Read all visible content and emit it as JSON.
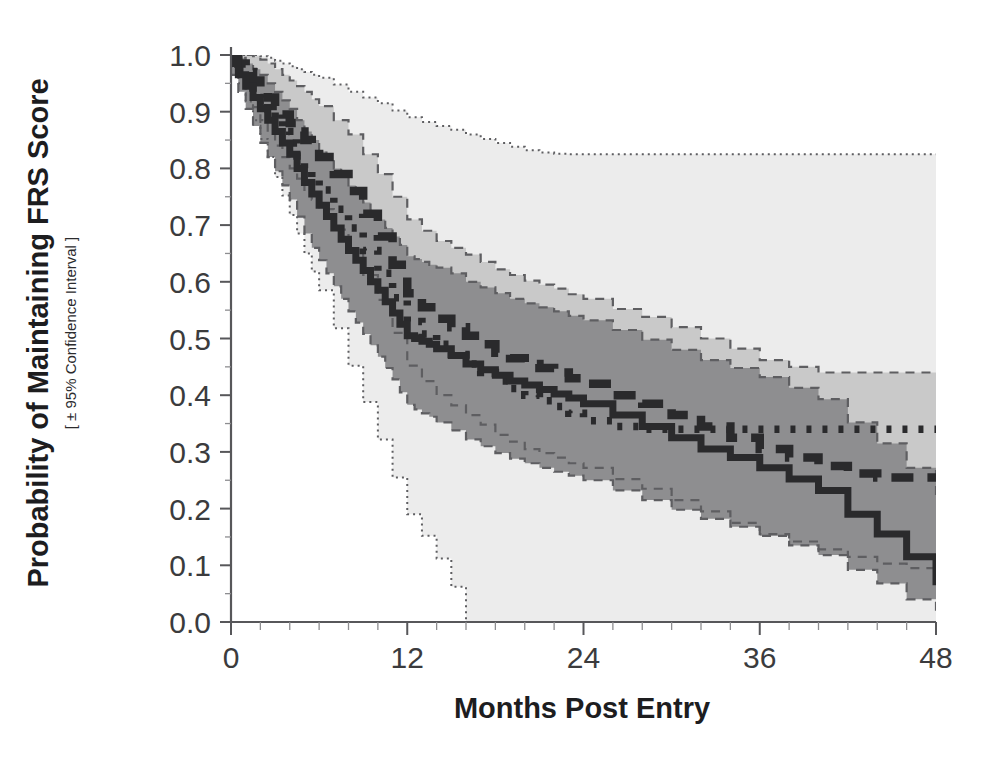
{
  "chart_data": {
    "type": "line",
    "title": "",
    "xlabel": "Months Post Entry",
    "ylabel": "Probability of Maintaining FRS Score",
    "ylabel_sub": "[ ± 95% Confidence Interval ]",
    "xlim": [
      0,
      48
    ],
    "ylim": [
      0,
      1.0
    ],
    "xticks": [
      0,
      12,
      24,
      36,
      48
    ],
    "xtick_labels": [
      "0",
      "12",
      "24",
      "36",
      "48"
    ],
    "yticks": [
      0.0,
      0.1,
      0.2,
      0.3,
      0.4,
      0.5,
      0.6,
      0.7,
      0.8,
      0.9,
      1.0
    ],
    "ytick_labels": [
      "0.0",
      "0.1",
      "0.2",
      "0.3",
      "0.4",
      "0.5",
      "0.6",
      "0.7",
      "0.8",
      "0.9",
      "1.0"
    ],
    "xminor_step": 2,
    "yminor_step": 0.05,
    "grid": false,
    "legend": "none",
    "colors": {
      "curve": "#2a2a2c",
      "band_outer": "#ececec",
      "band_mid": "#c9c9c9",
      "band_inner": "#8e8e90",
      "axis": "#57575a",
      "text": "#1d1d1f"
    },
    "series": [
      {
        "name": "solid",
        "style": "solid",
        "x": [
          0,
          0.5,
          1,
          1.5,
          2,
          2.5,
          3,
          3.5,
          4,
          4.5,
          5,
          5.5,
          6,
          6.5,
          7,
          7.5,
          8,
          8.5,
          9,
          9.5,
          10,
          10.5,
          11,
          11.5,
          12,
          12.5,
          13,
          13.5,
          14,
          15,
          16,
          17,
          18,
          19,
          20,
          21,
          22,
          23,
          24,
          26,
          28,
          30,
          32,
          34,
          36,
          38,
          40,
          42,
          44,
          46,
          48
        ],
        "values": [
          0.985,
          0.965,
          0.945,
          0.925,
          0.905,
          0.885,
          0.865,
          0.845,
          0.825,
          0.8,
          0.775,
          0.755,
          0.735,
          0.715,
          0.695,
          0.675,
          0.655,
          0.638,
          0.62,
          0.6,
          0.585,
          0.565,
          0.545,
          0.525,
          0.505,
          0.5,
          0.495,
          0.49,
          0.482,
          0.47,
          0.455,
          0.445,
          0.435,
          0.425,
          0.418,
          0.41,
          0.402,
          0.395,
          0.385,
          0.365,
          0.345,
          0.325,
          0.305,
          0.29,
          0.272,
          0.252,
          0.232,
          0.19,
          0.155,
          0.115,
          0.065
        ],
        "ci_upper": [
          1.0,
          0.995,
          0.985,
          0.975,
          0.965,
          0.95,
          0.935,
          0.92,
          0.905,
          0.885,
          0.865,
          0.85,
          0.83,
          0.815,
          0.8,
          0.785,
          0.77,
          0.755,
          0.74,
          0.725,
          0.71,
          0.695,
          0.68,
          0.665,
          0.645,
          0.64,
          0.635,
          0.63,
          0.625,
          0.615,
          0.6,
          0.59,
          0.58,
          0.57,
          0.562,
          0.555,
          0.548,
          0.54,
          0.532,
          0.515,
          0.498,
          0.48,
          0.462,
          0.448,
          0.432,
          0.413,
          0.393,
          0.352,
          0.315,
          0.272,
          0.215
        ],
        "ci_lower": [
          0.965,
          0.935,
          0.905,
          0.875,
          0.845,
          0.82,
          0.795,
          0.77,
          0.745,
          0.715,
          0.685,
          0.66,
          0.638,
          0.615,
          0.592,
          0.57,
          0.548,
          0.528,
          0.508,
          0.488,
          0.468,
          0.448,
          0.428,
          0.405,
          0.383,
          0.375,
          0.368,
          0.362,
          0.352,
          0.338,
          0.322,
          0.31,
          0.298,
          0.288,
          0.28,
          0.272,
          0.265,
          0.258,
          0.25,
          0.232,
          0.215,
          0.198,
          0.182,
          0.168,
          0.152,
          0.135,
          0.118,
          0.092,
          0.068,
          0.04,
          0.012
        ]
      },
      {
        "name": "dashed",
        "style": "dashed",
        "x": [
          0,
          0.5,
          1,
          1.5,
          2,
          2.5,
          3,
          3.5,
          4,
          4.5,
          5,
          5.5,
          6,
          7,
          8,
          9,
          10,
          11,
          12,
          13,
          14,
          15,
          16,
          17,
          18,
          19,
          20,
          21,
          22,
          23,
          24,
          26,
          28,
          30,
          32,
          34,
          36,
          38,
          40,
          42,
          44,
          46,
          48
        ],
        "values": [
          0.995,
          0.985,
          0.97,
          0.955,
          0.94,
          0.925,
          0.91,
          0.895,
          0.88,
          0.865,
          0.85,
          0.835,
          0.82,
          0.79,
          0.76,
          0.72,
          0.68,
          0.63,
          0.58,
          0.555,
          0.535,
          0.52,
          0.505,
          0.49,
          0.475,
          0.465,
          0.455,
          0.448,
          0.44,
          0.43,
          0.42,
          0.4,
          0.385,
          0.365,
          0.345,
          0.325,
          0.305,
          0.29,
          0.275,
          0.262,
          0.255,
          0.255,
          0.255
        ],
        "ci_upper": [
          1.0,
          1.0,
          1.0,
          0.998,
          0.992,
          0.985,
          0.975,
          0.965,
          0.955,
          0.945,
          0.935,
          0.922,
          0.91,
          0.885,
          0.86,
          0.825,
          0.79,
          0.75,
          0.71,
          0.69,
          0.672,
          0.66,
          0.648,
          0.635,
          0.622,
          0.612,
          0.602,
          0.595,
          0.588,
          0.578,
          0.57,
          0.552,
          0.538,
          0.52,
          0.5,
          0.482,
          0.462,
          0.45,
          0.44,
          0.44,
          0.44,
          0.44,
          0.44
        ],
        "ci_lower": [
          0.985,
          0.962,
          0.935,
          0.908,
          0.885,
          0.862,
          0.84,
          0.82,
          0.8,
          0.782,
          0.762,
          0.745,
          0.728,
          0.692,
          0.655,
          0.612,
          0.568,
          0.51,
          0.452,
          0.425,
          0.4,
          0.382,
          0.365,
          0.348,
          0.33,
          0.318,
          0.305,
          0.298,
          0.29,
          0.28,
          0.272,
          0.252,
          0.235,
          0.215,
          0.195,
          0.175,
          0.155,
          0.142,
          0.128,
          0.115,
          0.103,
          0.095,
          0.088
        ]
      },
      {
        "name": "dotted",
        "style": "dotted",
        "x": [
          0,
          0.5,
          1,
          1.5,
          2,
          2.5,
          3,
          3.5,
          4,
          4.5,
          5,
          5.5,
          6,
          7,
          8,
          9,
          10,
          11,
          12,
          13,
          14,
          15,
          16,
          17,
          18,
          19,
          20,
          21,
          22,
          23,
          24,
          26,
          28,
          30,
          32,
          34,
          36,
          38,
          40,
          42,
          44,
          46,
          48
        ],
        "values": [
          0.99,
          0.975,
          0.96,
          0.942,
          0.925,
          0.905,
          0.885,
          0.865,
          0.845,
          0.822,
          0.8,
          0.782,
          0.762,
          0.728,
          0.695,
          0.655,
          0.615,
          0.572,
          0.53,
          0.508,
          0.49,
          0.472,
          0.455,
          0.44,
          0.425,
          0.412,
          0.4,
          0.39,
          0.38,
          0.368,
          0.355,
          0.345,
          0.34,
          0.34,
          0.34,
          0.34,
          0.34,
          0.34,
          0.34,
          0.34,
          0.34,
          0.34,
          0.34
        ],
        "ci_upper": [
          1.0,
          1.0,
          1.0,
          1.0,
          0.998,
          0.995,
          0.99,
          0.985,
          0.98,
          0.975,
          0.97,
          0.965,
          0.96,
          0.948,
          0.935,
          0.925,
          0.915,
          0.902,
          0.89,
          0.882,
          0.875,
          0.868,
          0.86,
          0.852,
          0.845,
          0.838,
          0.832,
          0.828,
          0.826,
          0.825,
          0.825,
          0.825,
          0.825,
          0.825,
          0.825,
          0.825,
          0.825,
          0.825,
          0.825,
          0.825,
          0.825,
          0.825,
          0.825
        ],
        "ci_lower": [
          0.98,
          0.95,
          0.918,
          0.885,
          0.852,
          0.82,
          0.785,
          0.752,
          0.718,
          0.685,
          0.65,
          0.618,
          0.585,
          0.518,
          0.452,
          0.388,
          0.322,
          0.255,
          0.19,
          0.152,
          0.112,
          0.062,
          0.0,
          0.0,
          0.0,
          0.0,
          0.0,
          0.0,
          0.0,
          0.0,
          0.0,
          0.0,
          0.0,
          0.0,
          0.0,
          0.0,
          0.0,
          0.0,
          0.0,
          0.0,
          0.0,
          0.0,
          0.0
        ]
      }
    ]
  }
}
